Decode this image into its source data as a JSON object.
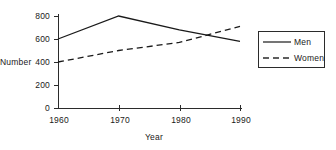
{
  "chart_data": {
    "type": "line",
    "title": "",
    "xlabel": "Year",
    "ylabel": "Number",
    "x": [
      1960,
      1970,
      1980,
      1990
    ],
    "xticklabels": [
      "1960",
      "1970",
      "1980",
      "1990"
    ],
    "yticks": [
      0,
      200,
      400,
      600,
      800
    ],
    "yticklabels": [
      "0",
      "200",
      "400",
      "600",
      "800"
    ],
    "xlim": [
      1960,
      1990
    ],
    "ylim": [
      0,
      800
    ],
    "grid": false,
    "legend_position": "right",
    "series": [
      {
        "name": "Men",
        "style": "solid",
        "color": "#1a1a1a",
        "values": [
          600,
          800,
          680,
          580
        ]
      },
      {
        "name": "Women",
        "style": "dashed",
        "color": "#1a1a1a",
        "values": [
          400,
          500,
          570,
          710
        ]
      }
    ]
  },
  "axes": {
    "ylabel": "Number",
    "xlabel": "Year",
    "yticklabels": [
      "800",
      "600",
      "400",
      "200",
      "0"
    ],
    "xticklabels": [
      "1960",
      "1970",
      "1980",
      "1990"
    ]
  },
  "legend": {
    "entries": [
      {
        "label": "Men",
        "style": "solid"
      },
      {
        "label": "Women",
        "style": "dashed"
      }
    ]
  },
  "colors": {
    "ink": "#1a1a1a",
    "line": "#2b2b2b",
    "background": "#ffffff"
  }
}
